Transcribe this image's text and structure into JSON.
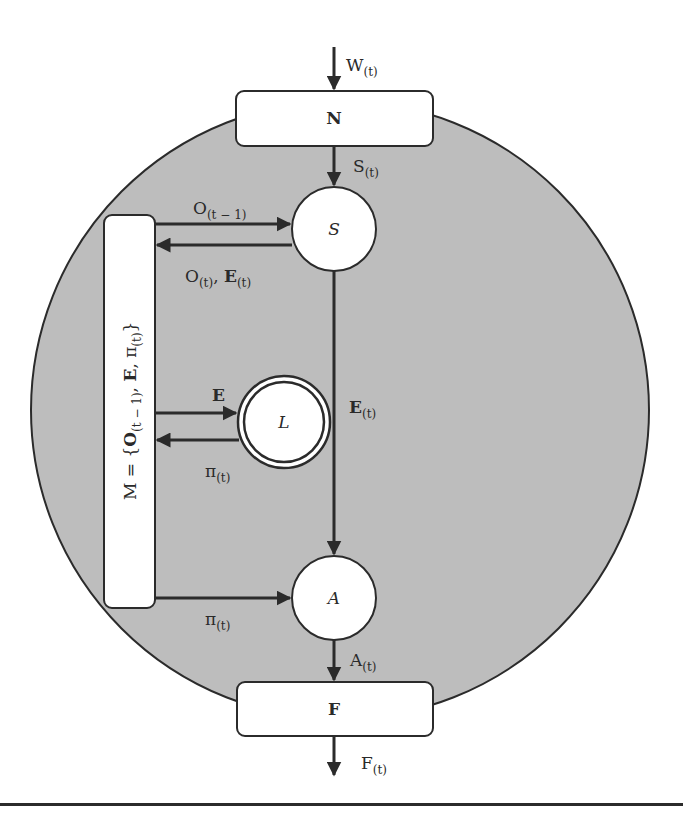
{
  "diagram": {
    "colors": {
      "background": "#ffffff",
      "environment_fill": "#bdbdbd",
      "stroke": "#2b2b2b",
      "node_fill": "#ffffff"
    },
    "boxes": {
      "N": {
        "label": "N"
      },
      "F": {
        "label": "F"
      },
      "M": {
        "label_main": "M = {",
        "label_O": "O",
        "label_O_sub": "(t − 1)",
        "label_comma1": ", ",
        "label_E": "E",
        "label_comma2": ", π",
        "label_pi_sub": "(t)",
        "label_close": "}"
      }
    },
    "nodes": {
      "S": {
        "label": "S"
      },
      "L": {
        "label": "L"
      },
      "A": {
        "label": "A"
      }
    },
    "edges": {
      "W_in": {
        "main": "W",
        "sub": "(t)"
      },
      "S_t": {
        "main": "S",
        "sub": "(t)"
      },
      "O_prev": {
        "main": "O",
        "sub": "(t − 1)"
      },
      "O_E_back": {
        "main1": "O",
        "sub1": "(t)",
        "sep": ", ",
        "main2": "E",
        "sub2": "(t)"
      },
      "E_to_L": {
        "main": "E"
      },
      "pi_from_L": {
        "main": "π",
        "sub": "(t)"
      },
      "E_t": {
        "main": "E",
        "sub": "(t)"
      },
      "pi_to_A": {
        "main": "π",
        "sub": "(t)"
      },
      "A_t": {
        "main": "A",
        "sub": "(t)"
      },
      "F_t": {
        "main": "F",
        "sub": "(t)"
      }
    }
  }
}
